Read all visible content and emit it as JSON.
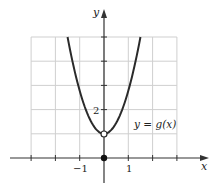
{
  "chart_data": {
    "type": "line",
    "title": "",
    "xlabel": "x",
    "ylabel": "y",
    "xlim": [
      -3,
      3
    ],
    "ylim": [
      0,
      5
    ],
    "grid": true,
    "x_tick_labels": [
      {
        "value": -1,
        "label": "−1"
      },
      {
        "value": 1,
        "label": "1"
      }
    ],
    "y_tick_labels": [
      {
        "value": 2,
        "label": "2"
      }
    ],
    "x_ticks": [
      -3,
      -2,
      -1,
      0,
      1,
      2,
      3
    ],
    "y_ticks": [
      1,
      2,
      3,
      4,
      5
    ],
    "series": [
      {
        "name": "y = g(x)",
        "description": "parabola-like curve opening upward, vertex at (0,1) with open circle; reaches y=5 near x=±1.5",
        "x": [
          -1.5,
          -1.0,
          -0.5,
          0,
          0.5,
          1.0,
          1.5
        ],
        "y": [
          5,
          2.78,
          1.44,
          1,
          1.44,
          2.78,
          5
        ]
      }
    ],
    "points": [
      {
        "x": 0,
        "y": 1,
        "style": "open"
      },
      {
        "x": 0,
        "y": 0,
        "style": "filled"
      }
    ],
    "annotations": [
      {
        "text": "y = g(x)",
        "x": 1.2,
        "y": 1.4
      }
    ]
  },
  "labels": {
    "x_axis": "x",
    "y_axis": "y",
    "tick_neg1": "−1",
    "tick_1": "1",
    "tick_2": "2",
    "curve_label": "y = g(x)"
  },
  "colors": {
    "grid": "#cfcfcf",
    "axis": "#333333",
    "curve": "#2a2a2a"
  }
}
